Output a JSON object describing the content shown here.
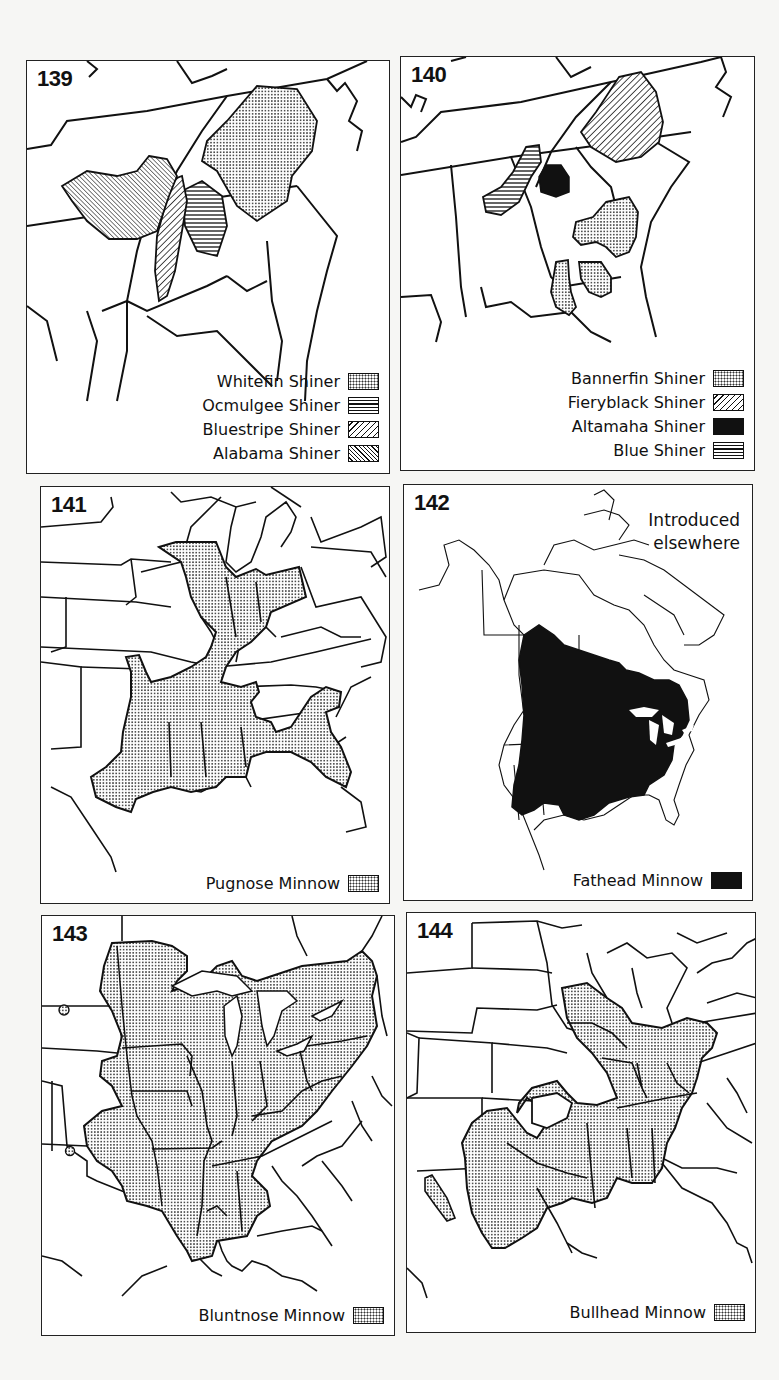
{
  "maps": [
    {
      "number": "139",
      "region": "Southeastern United States",
      "legend": [
        {
          "label": "Whitefin Shiner",
          "pattern": "stippled-dots"
        },
        {
          "label": "Ocmulgee Shiner",
          "pattern": "horizontal-lines"
        },
        {
          "label": "Bluestripe Shiner",
          "pattern": "diagonal-lines-right"
        },
        {
          "label": "Alabama Shiner",
          "pattern": "diagonal-lines-left"
        }
      ]
    },
    {
      "number": "140",
      "region": "Southeastern United States",
      "legend": [
        {
          "label": "Bannerfin Shiner",
          "pattern": "stippled-dots"
        },
        {
          "label": "Fieryblack Shiner",
          "pattern": "diagonal-lines-right"
        },
        {
          "label": "Altamaha Shiner",
          "pattern": "solid-black"
        },
        {
          "label": "Blue Shiner",
          "pattern": "horizontal-lines"
        }
      ]
    },
    {
      "number": "141",
      "region": "Eastern United States",
      "legend": [
        {
          "label": "Pugnose Minnow",
          "pattern": "stippled-dots"
        }
      ]
    },
    {
      "number": "142",
      "region": "North America",
      "note_line1": "Introduced",
      "note_line2": "elsewhere",
      "legend": [
        {
          "label": "Fathead Minnow",
          "pattern": "solid-black"
        }
      ]
    },
    {
      "number": "143",
      "region": "Eastern United States",
      "legend": [
        {
          "label": "Bluntnose Minnow",
          "pattern": "stippled-dots"
        }
      ]
    },
    {
      "number": "144",
      "region": "Central and Eastern United States",
      "legend": [
        {
          "label": "Bullhead Minnow",
          "pattern": "stippled-dots"
        }
      ]
    }
  ],
  "colors": {
    "ink": "#111111",
    "paper": "#ffffff",
    "background": "#f6f6f4"
  }
}
